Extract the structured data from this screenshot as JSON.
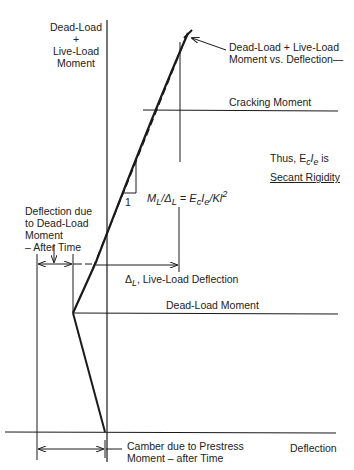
{
  "diagram": {
    "y_axis_label": [
      "Dead-Load",
      "+",
      "Live-Load",
      "Moment"
    ],
    "x_axis_label": "Deflection",
    "curve_label": [
      "Dead-Load + Live-Load",
      "Moment vs. Deflection—"
    ],
    "cracking_moment_label": "Cracking Moment",
    "dead_load_moment_label": "Dead-Load Moment",
    "secant_note_line1": "Thus, E",
    "secant_note_sub1": "c",
    "secant_note_mid": "I",
    "secant_note_sub2": "e",
    "secant_note_end": " is",
    "secant_note_line2": "Secant Rigidity",
    "slope_unit": "1",
    "formula": {
      "m": "M",
      "m_sub": "L",
      "slash": "/Δ",
      "d_sub": "L",
      "eq": " = E",
      "e_sub": "c",
      "i": "I",
      "i_sub": "e",
      "tail": "/Kl",
      "sup": "2"
    },
    "live_load_deflection_label": {
      "delta": "Δ",
      "sub": "L",
      "text": ", Live-Load Deflection"
    },
    "dead_load_deflection_label": [
      "Deflection due",
      "to Dead-Load",
      "Moment",
      "– After Time"
    ],
    "camber_label": [
      "Camber due to Prestress",
      "Moment – after Time"
    ],
    "colors": {
      "line": "#1a1a1a",
      "background": "#ffffff"
    }
  }
}
